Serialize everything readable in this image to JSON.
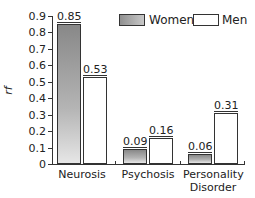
{
  "chart_data": {
    "type": "bar",
    "title": "",
    "xlabel": "",
    "ylabel": "rf",
    "ylim": [
      0,
      0.9
    ],
    "yticks": [
      "0",
      "0.1",
      "0.2",
      "0.3",
      "0.4",
      "0.5",
      "0.6",
      "0.7",
      "0.8",
      "0.9"
    ],
    "categories": [
      "Neurosis",
      "Psychosis",
      "Personality Disorder"
    ],
    "series": [
      {
        "name": "Women",
        "values": [
          0.85,
          0.09,
          0.06
        ],
        "labels": [
          "0.85",
          "0.09",
          "0.06"
        ]
      },
      {
        "name": "Men",
        "values": [
          0.53,
          0.16,
          0.31
        ],
        "labels": [
          "0.53",
          "0.16",
          "0.31"
        ]
      }
    ],
    "legend_position": "top-right",
    "grid": false
  },
  "legend": {
    "women": "Women",
    "men": "Men"
  },
  "categories": {
    "c0": "Neurosis",
    "c1": "Psychosis",
    "c2a": "Personality",
    "c2b": "Disorder"
  }
}
